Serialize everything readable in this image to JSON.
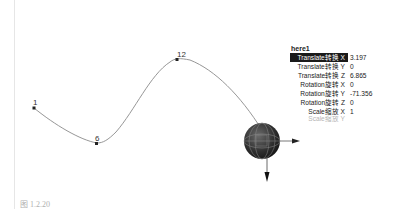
{
  "viewport": {
    "curve_points": [
      {
        "label": "1",
        "name": "cv-point-1"
      },
      {
        "label": "6",
        "name": "cv-point-6"
      },
      {
        "label": "12",
        "name": "cv-point-12"
      }
    ]
  },
  "channel_box": {
    "node_name": "here1",
    "channels": [
      {
        "label": "Translate转换 X",
        "value": "3.197",
        "selected": true
      },
      {
        "label": "Translate转换 Y",
        "value": "0"
      },
      {
        "label": "Translate转换 Z",
        "value": "6.865"
      },
      {
        "label": "Rotation旋转 X",
        "value": "0"
      },
      {
        "label": "Rotation旋转 Y",
        "value": "-71.356"
      },
      {
        "label": "Rotation旋转 Z",
        "value": "0"
      },
      {
        "label": "Scale缩放 X",
        "value": "1"
      },
      {
        "label": "Scale缩放 Y",
        "value": ""
      }
    ]
  },
  "colors": {
    "curve": "#8a8a8a",
    "sphere": "#3a3a3a",
    "selected_bg": "#1a1a1a"
  },
  "caption": "图 1.2.20"
}
